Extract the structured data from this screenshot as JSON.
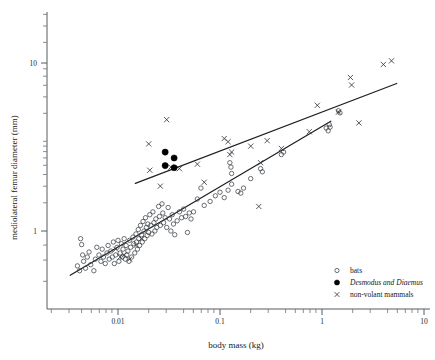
{
  "chart_data": {
    "type": "scatter",
    "title": "",
    "xlabel": "body mass (kg)",
    "ylabel": "mediolateral femur diameter (mm)",
    "xscale": "log",
    "yscale": "log",
    "xlim": [
      0.003,
      10
    ],
    "ylim": [
      0.45,
      16
    ],
    "xticks": [
      0.01,
      0.1,
      1,
      10
    ],
    "xticklabels": [
      "0.01",
      "0.1",
      "1",
      "10"
    ],
    "yticks": [
      1,
      10
    ],
    "yticklabels": [
      "1",
      "10"
    ],
    "grid": false,
    "legend_position": "bottom-right",
    "legend": [
      {
        "label": "bats",
        "marker": "open-circle"
      },
      {
        "label": "Desmodus and Diaemus",
        "marker": "filled-circle",
        "italic_words": [
          "Desmodus",
          "Diaemus"
        ]
      },
      {
        "label": "non-volant mammals",
        "marker": "cross"
      }
    ],
    "series": [
      {
        "name": "bats",
        "marker": "open-circle",
        "points": [
          [
            0.004,
            0.62
          ],
          [
            0.0042,
            0.58
          ],
          [
            0.0043,
            0.9
          ],
          [
            0.0044,
            0.83
          ],
          [
            0.0045,
            0.72
          ],
          [
            0.0046,
            0.66
          ],
          [
            0.0048,
            0.6
          ],
          [
            0.005,
            0.7
          ],
          [
            0.0052,
            0.75
          ],
          [
            0.0054,
            0.63
          ],
          [
            0.0058,
            0.58
          ],
          [
            0.006,
            0.68
          ],
          [
            0.0062,
            0.8
          ],
          [
            0.0065,
            0.72
          ],
          [
            0.0068,
            0.66
          ],
          [
            0.007,
            0.78
          ],
          [
            0.0072,
            0.7
          ],
          [
            0.0075,
            0.64
          ],
          [
            0.0078,
            0.74
          ],
          [
            0.008,
            0.82
          ],
          [
            0.0082,
            0.68
          ],
          [
            0.0085,
            0.76
          ],
          [
            0.0088,
            0.7
          ],
          [
            0.009,
            0.86
          ],
          [
            0.0092,
            0.64
          ],
          [
            0.0095,
            0.72
          ],
          [
            0.0098,
            0.8
          ],
          [
            0.01,
            0.88
          ],
          [
            0.0102,
            0.66
          ],
          [
            0.0105,
            0.74
          ],
          [
            0.0108,
            0.84
          ],
          [
            0.011,
            0.7
          ],
          [
            0.0112,
            0.78
          ],
          [
            0.0115,
            0.9
          ],
          [
            0.0118,
            0.68
          ],
          [
            0.012,
            0.82
          ],
          [
            0.0122,
            0.72
          ],
          [
            0.0125,
            0.76
          ],
          [
            0.0128,
            0.66
          ],
          [
            0.013,
            0.88
          ],
          [
            0.0133,
            0.8
          ],
          [
            0.0136,
            0.7
          ],
          [
            0.014,
            0.92
          ],
          [
            0.0143,
            0.84
          ],
          [
            0.0146,
            0.74
          ],
          [
            0.015,
            0.96
          ],
          [
            0.0152,
            0.86
          ],
          [
            0.0155,
            0.78
          ],
          [
            0.0158,
            1.02
          ],
          [
            0.016,
            0.9
          ],
          [
            0.0163,
            0.82
          ],
          [
            0.0166,
            1.08
          ],
          [
            0.017,
            0.95
          ],
          [
            0.0173,
            0.86
          ],
          [
            0.0176,
            1.14
          ],
          [
            0.018,
            1.0
          ],
          [
            0.0183,
            0.9
          ],
          [
            0.0186,
            1.2
          ],
          [
            0.019,
            1.05
          ],
          [
            0.0193,
            0.94
          ],
          [
            0.0196,
            1.1
          ],
          [
            0.02,
            0.98
          ],
          [
            0.0205,
            1.25
          ],
          [
            0.021,
            1.08
          ],
          [
            0.0215,
            0.96
          ],
          [
            0.022,
            1.3
          ],
          [
            0.0225,
            1.12
          ],
          [
            0.023,
            1.0
          ],
          [
            0.0235,
            1.18
          ],
          [
            0.024,
            1.05
          ],
          [
            0.025,
            1.4
          ],
          [
            0.0255,
            1.22
          ],
          [
            0.026,
            1.08
          ],
          [
            0.027,
            1.45
          ],
          [
            0.0275,
            1.28
          ],
          [
            0.028,
            1.12
          ],
          [
            0.029,
            1.2
          ],
          [
            0.03,
            1.05
          ],
          [
            0.031,
            1.38
          ],
          [
            0.032,
            1.18
          ],
          [
            0.033,
            1.0
          ],
          [
            0.034,
            1.25
          ],
          [
            0.035,
            1.1
          ],
          [
            0.036,
            0.95
          ],
          [
            0.038,
            1.15
          ],
          [
            0.04,
            1.3
          ],
          [
            0.042,
            1.2
          ],
          [
            0.044,
            1.35
          ],
          [
            0.046,
            1.22
          ],
          [
            0.048,
            0.98
          ],
          [
            0.05,
            1.28
          ],
          [
            0.052,
            1.18
          ],
          [
            0.055,
            1.3
          ],
          [
            0.06,
            1.55
          ],
          [
            0.065,
            1.8
          ],
          [
            0.07,
            1.42
          ],
          [
            0.08,
            1.5
          ],
          [
            0.09,
            1.62
          ],
          [
            0.1,
            1.7
          ],
          [
            0.11,
            1.58
          ],
          [
            0.12,
            1.75
          ],
          [
            0.13,
            1.9
          ],
          [
            0.125,
            2.55
          ],
          [
            0.128,
            2.4
          ],
          [
            0.13,
            2.2
          ],
          [
            0.15,
            1.72
          ],
          [
            0.16,
            1.68
          ],
          [
            0.17,
            1.8
          ],
          [
            0.2,
            2.05
          ],
          [
            0.25,
            2.35
          ],
          [
            0.26,
            2.25
          ],
          [
            0.4,
            2.85
          ],
          [
            0.42,
            2.95
          ],
          [
            1.1,
            4.1
          ],
          [
            1.15,
            3.95
          ],
          [
            1.18,
            4.3
          ],
          [
            1.2,
            4.15
          ],
          [
            1.45,
            5.2
          ],
          [
            1.5,
            5.05
          ]
        ]
      },
      {
        "name": "Desmodus and Diaemus",
        "marker": "filled-circle",
        "points": [
          [
            0.029,
            2.95
          ],
          [
            0.029,
            2.45
          ],
          [
            0.0355,
            2.72
          ],
          [
            0.0355,
            2.38
          ]
        ]
      },
      {
        "name": "non-volant mammals",
        "marker": "cross",
        "points": [
          [
            0.0095,
            0.78
          ],
          [
            0.0105,
            0.7
          ],
          [
            0.0115,
            0.72
          ],
          [
            0.013,
            0.68
          ],
          [
            0.015,
            0.82
          ],
          [
            0.017,
            0.9
          ],
          [
            0.02,
            3.3
          ],
          [
            0.0205,
            2.3
          ],
          [
            0.026,
            1.85
          ],
          [
            0.03,
            4.6
          ],
          [
            0.033,
            2.4
          ],
          [
            0.04,
            2.35
          ],
          [
            0.06,
            2.5
          ],
          [
            0.07,
            1.95
          ],
          [
            0.11,
            3.55
          ],
          [
            0.12,
            3.4
          ],
          [
            0.125,
            2.85
          ],
          [
            0.13,
            2.95
          ],
          [
            0.2,
            3.2
          ],
          [
            0.24,
            1.4
          ],
          [
            0.25,
            2.55
          ],
          [
            0.29,
            3.45
          ],
          [
            0.4,
            3.1
          ],
          [
            0.75,
            3.9
          ],
          [
            0.9,
            5.6
          ],
          [
            1.45,
            5.1
          ],
          [
            1.9,
            8.2
          ],
          [
            1.95,
            7.4
          ],
          [
            2.3,
            4.4
          ],
          [
            4.0,
            9.8
          ],
          [
            4.8,
            10.3
          ]
        ]
      }
    ],
    "fit_lines": [
      {
        "name": "non-volant mammals regression",
        "x_start": 0.0148,
        "y_start": 1.92,
        "x_end": 5.4,
        "y_end": 7.55
      },
      {
        "name": "bats regression",
        "x_start": 0.0034,
        "y_start": 0.545,
        "x_end": 1.22,
        "y_end": 4.5
      }
    ]
  }
}
